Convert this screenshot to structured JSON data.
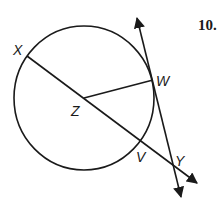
{
  "problem": {
    "number": "10."
  },
  "labels": {
    "X": "X",
    "W": "W",
    "Z": "Z",
    "V": "V",
    "Y": "Y"
  },
  "figure": {
    "circle": {
      "center": "Z"
    },
    "segments": [
      "ZW"
    ],
    "lines": [
      "secant XY through Z and V",
      "tangent line through W and Y"
    ]
  },
  "colors": {
    "stroke": "#1a1a1a",
    "background": "#ffffff"
  }
}
